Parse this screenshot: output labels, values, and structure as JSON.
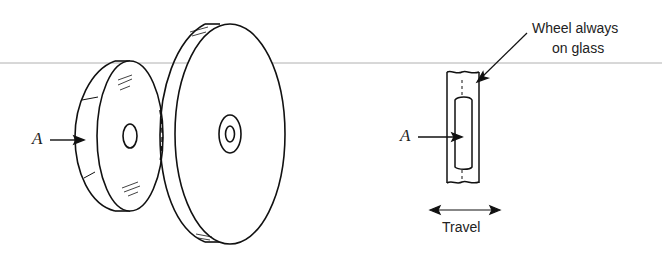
{
  "figure": {
    "labels": {
      "a_left": "A",
      "a_right": "A",
      "annotation_line1": "Wheel always",
      "annotation_line2": "on glass",
      "travel": "Travel"
    },
    "colors": {
      "stroke": "#111111",
      "guide_line": "#b0b0b0",
      "background": "#ffffff"
    }
  }
}
